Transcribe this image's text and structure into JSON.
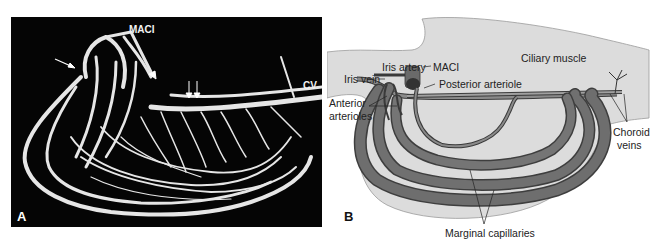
{
  "figure": {
    "panel_a": {
      "letter": "A",
      "description": "Vascular corrosion cast micrograph of ciliary process vasculature",
      "labels": {
        "maci": "MACI",
        "cv": "CV"
      },
      "markers": [
        "arrow",
        "arrowhead",
        "double-arrows"
      ]
    },
    "panel_b": {
      "letter": "B",
      "description": "Schematic of ciliary process vasculature",
      "labels": {
        "ciliary_muscle": "Ciliary muscle",
        "iris_artery": "Iris artery",
        "maci": "MACI",
        "iris_vein": "Iris vein",
        "posterior_arteriole": "Posterior arteriole",
        "anterior_arterioles_line1": "Anterior",
        "anterior_arterioles_line2": "arterioles",
        "choroid_veins_line1": "Choroid",
        "choroid_veins_line2": "veins",
        "marginal_capillaries": "Marginal capillaries"
      }
    },
    "colors": {
      "panel_a_background": "#050505",
      "vessel_cast": "#e8e8e8",
      "tissue_fill": "#dcdcdc",
      "vessel_fill": "#6e6e6e",
      "vessel_stroke": "#3a3a3a"
    }
  }
}
